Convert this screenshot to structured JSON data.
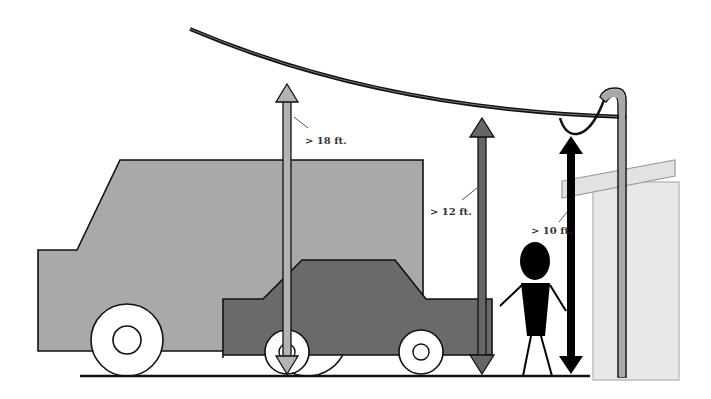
{
  "diagram": {
    "type": "clearance-illustration",
    "colors": {
      "background": "#ffffff",
      "truck": "#a9a9a9",
      "car": "#6a6a6a",
      "outline": "#111111",
      "wheel": "#ffffff",
      "arrow_18": "#b3b3b3",
      "arrow_12": "#666666",
      "arrow_10": "#000000",
      "house_wall": "#e8e8e8",
      "house_eave": "#e0e0e0",
      "service_mast": "#a8a8a8",
      "person": "#000000",
      "ground": "#111111"
    },
    "labels": {
      "clearance_18": "> 18 ft.",
      "clearance_12": "> 12 ft.",
      "clearance_10": "> 10 ft."
    },
    "elements": [
      {
        "name": "overhead-wire",
        "description": "Sagging overhead service drop cable"
      },
      {
        "name": "service-mast",
        "description": "Weatherhead mast on house with drip loop"
      },
      {
        "name": "truck",
        "description": "Large truck silhouette (light gray)"
      },
      {
        "name": "car",
        "description": "Passenger car silhouette (dark gray)"
      },
      {
        "name": "person",
        "description": "Stick figure pedestrian"
      },
      {
        "name": "house",
        "description": "House wall and eave"
      },
      {
        "name": "ground-line",
        "description": "Ground level"
      }
    ],
    "clearances": [
      {
        "label": "> 18 ft.",
        "context": "over roads / truck traffic",
        "arrow_color": "#b3b3b3"
      },
      {
        "label": "> 12 ft.",
        "context": "over driveways / residential",
        "arrow_color": "#666666"
      },
      {
        "label": "> 10 ft.",
        "context": "over pedestrian areas at drip loop",
        "arrow_color": "#000000"
      }
    ]
  }
}
